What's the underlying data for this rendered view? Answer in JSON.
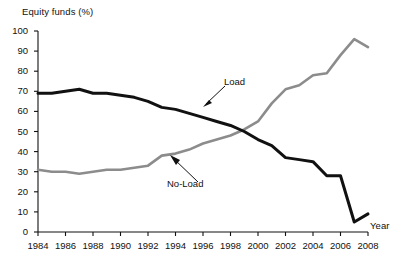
{
  "chart_data": {
    "type": "line",
    "title": "",
    "xlabel": "Year",
    "ylabel": "Equity funds (%)",
    "ylim": [
      0,
      100
    ],
    "xlim": [
      1984,
      2008
    ],
    "grid": false,
    "legend_position": "inline-annotation",
    "yticks": [
      0,
      10,
      20,
      30,
      40,
      50,
      60,
      70,
      80,
      90,
      100
    ],
    "ytick_labels": [
      "0",
      "10",
      "20",
      "30",
      "40",
      "50",
      "60",
      "70",
      "80",
      "90",
      "100"
    ],
    "xticks": [
      1984,
      1986,
      1988,
      1990,
      1992,
      1994,
      1996,
      1998,
      2000,
      2002,
      2004,
      2006,
      2008
    ],
    "xtick_labels": [
      "1984",
      "1986",
      "1988",
      "1990",
      "1992",
      "1994",
      "1996",
      "1998",
      "2000",
      "2002",
      "2004",
      "2006",
      "2008"
    ],
    "x": [
      1984,
      1985,
      1986,
      1987,
      1988,
      1989,
      1990,
      1991,
      1992,
      1993,
      1994,
      1995,
      1996,
      1997,
      1998,
      1999,
      2000,
      2001,
      2002,
      2003,
      2004,
      2005,
      2006,
      2007,
      2008
    ],
    "series": [
      {
        "name": "Load",
        "color": "#111111",
        "values": [
          69,
          69,
          70,
          71,
          69,
          69,
          68,
          67,
          65,
          62,
          61,
          59,
          57,
          55,
          53,
          50,
          46,
          43,
          37,
          36,
          35,
          28,
          28,
          5,
          9
        ]
      },
      {
        "name": "No-Load",
        "color": "#8c8c8c",
        "values": [
          31,
          30,
          30,
          29,
          30,
          31,
          31,
          32,
          33,
          38,
          39,
          41,
          44,
          46,
          48,
          51,
          55,
          64,
          71,
          73,
          78,
          79,
          88,
          96,
          92
        ]
      }
    ],
    "annotations": [
      {
        "text": "Load",
        "series": "Load",
        "x": 1998,
        "y": 55
      },
      {
        "text": "No-Load",
        "series": "No-Load",
        "x": 1994,
        "y": 38
      }
    ]
  },
  "labels": {
    "y_axis_title": "Equity funds (%)",
    "x_axis_title": "Year",
    "load": "Load",
    "no_load": "No-Load"
  }
}
